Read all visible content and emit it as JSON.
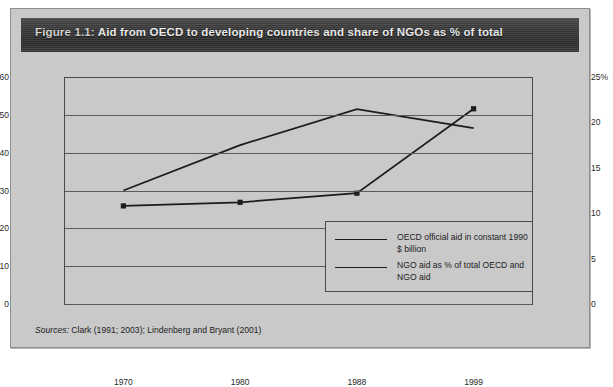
{
  "figure": {
    "number": "Figure 1.1:",
    "title": "Aid from OECD to developing countries and share of NGOs as % of total",
    "source_label": "Sources:",
    "source_text": "Clark (1991; 2003); Lindenberg and Bryant (2001)"
  },
  "legend": {
    "items": [
      {
        "label": "OECD official aid in constant 1990 $ billion"
      },
      {
        "label": "NGO aid as % of total OECD and NGO aid"
      }
    ]
  },
  "colors": {
    "header_bar": "#333333",
    "header_text": "#f2f2f2",
    "panel_background": "#c9c9c9",
    "axis": "#4a4a4a",
    "gridline": "#5a5a5a",
    "series_line": "#1c1c1c",
    "page_background": "#ffffff"
  },
  "chart_data": {
    "type": "line",
    "title": "Aid from OECD to developing countries and share of NGOs as % of total",
    "xlabel": "",
    "ylabel": "",
    "x": [
      "1970",
      "1980",
      "1988",
      "1999"
    ],
    "categories": [
      "1970",
      "1980",
      "1988",
      "1999"
    ],
    "grid": true,
    "legend_position": "inside-bottom-right",
    "axes": {
      "left": {
        "label": "OECD official aid (constant 1990 $ billion)",
        "ylim": [
          0,
          60
        ],
        "ticks": [
          0,
          10,
          20,
          30,
          40,
          50,
          60
        ],
        "tick_labels": [
          "0",
          "10",
          "20",
          "30",
          "40",
          "50",
          "$60"
        ]
      },
      "right": {
        "label": "NGO aid as % of total",
        "ylim": [
          0,
          25
        ],
        "ticks": [
          0,
          5,
          10,
          15,
          20,
          25
        ],
        "tick_labels": [
          "0",
          "5",
          "10",
          "15",
          "20",
          "25%"
        ]
      }
    },
    "series": [
      {
        "name": "OECD official aid in constant 1990 $ billion",
        "axis": "left",
        "units": "billion constant 1990 US$",
        "markers": false,
        "values": [
          30,
          42,
          51.5,
          46.5
        ]
      },
      {
        "name": "NGO aid as % of total OECD and NGO aid",
        "axis": "right",
        "units": "percent",
        "markers": true,
        "marker_shape": "square",
        "values": [
          10.8,
          11.2,
          12.2,
          21.5
        ]
      }
    ]
  },
  "axis_labels": {
    "left": [
      "$60",
      "50",
      "40",
      "30",
      "20",
      "10",
      "0"
    ],
    "right": [
      "25%",
      "20",
      "15",
      "10",
      "5",
      "0"
    ],
    "x": [
      "1970",
      "1980",
      "1988",
      "1999"
    ]
  }
}
